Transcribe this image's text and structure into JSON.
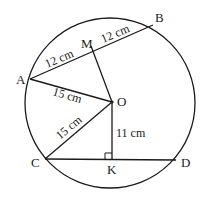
{
  "diagram": {
    "points": {
      "A": {
        "label": "A"
      },
      "B": {
        "label": "B"
      },
      "M": {
        "label": "M"
      },
      "O": {
        "label": "O"
      },
      "C": {
        "label": "C"
      },
      "K": {
        "label": "K"
      },
      "D": {
        "label": "D"
      }
    },
    "measurements": {
      "AM": "12 cm",
      "MB": "12 cm",
      "AO": "15 cm",
      "CO": "15 cm",
      "OK": "11 cm"
    },
    "colors": {
      "stroke": "#1a1a1a",
      "background": "#ffffff"
    }
  }
}
